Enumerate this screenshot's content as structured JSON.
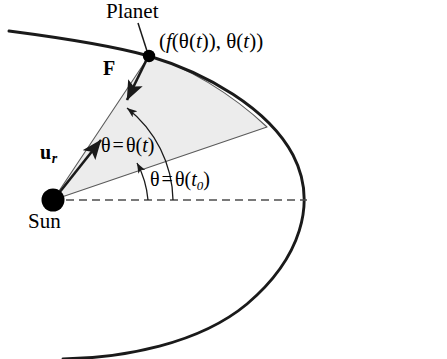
{
  "figure": {
    "background_color": "#ffffff",
    "stroke_color": "#1a1a1a",
    "sector_fill_color": "#ececec",
    "sector_stroke_color": "#555555",
    "dashed_color": "#4d4d4d",
    "width": 447,
    "height": 359
  },
  "labels": {
    "planet": "Planet",
    "sun": "Sun",
    "coordinate": "(f(θ(t)), θ(t))",
    "force_vector": "F",
    "unit_radial_vector": "u",
    "unit_radial_subscript": "r",
    "theta_t": "θ = θ(t)",
    "theta_t0": "θ = θ(t₀)"
  },
  "theta_t_parts": {
    "theta": "θ",
    "equals": "=",
    "theta2": "θ",
    "open": "(",
    "arg": "t",
    "close": ")"
  },
  "theta_t0_parts": {
    "theta": "θ",
    "equals": "=",
    "theta2": "θ",
    "open": "(",
    "arg": "t",
    "sub": "0",
    "close": ")"
  },
  "coordinate_parts": {
    "open": "(",
    "f": "f",
    "open2": "(",
    "theta": "θ",
    "open3": "(",
    "t1": "t",
    "close3": ")",
    "close2": ")",
    "comma": ",",
    "theta2": "θ",
    "open4": "(",
    "t2": "t",
    "close4": ")",
    "close": ")"
  },
  "geometry": {
    "sun_center": [
      53,
      200
    ],
    "sun_radius": 11,
    "planet_center": [
      149,
      56
    ],
    "planet_radius": 6,
    "sector_outer_point": [
      268,
      127
    ],
    "orbit_rightmost": [
      306,
      200
    ],
    "dashed_axis_y": 200,
    "dashed_axis_x_start": 66,
    "dashed_axis_x_end": 307,
    "force_arrow_from": [
      147,
      60
    ],
    "force_arrow_to": [
      128,
      99
    ],
    "ur_arrow_from": [
      58,
      194
    ],
    "ur_arrow_to": [
      101,
      139
    ],
    "planet_leader_from": [
      139,
      24
    ],
    "planet_leader_to": [
      146,
      52
    ],
    "theta_t_arc_radius": 88,
    "theta_t0_arc_radius": 120,
    "theta_t_angle_deg": 52,
    "theta_t0_angle_deg": 31
  }
}
